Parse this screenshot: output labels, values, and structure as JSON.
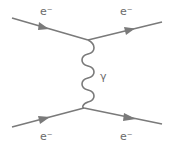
{
  "diagram": {
    "type": "feynman",
    "line_color": "#7a7a7a",
    "particles": {
      "incoming_top": {
        "label": "e⁻"
      },
      "outgoing_top": {
        "label": "e⁻"
      },
      "incoming_bottom": {
        "label": "e⁻"
      },
      "outgoing_bottom": {
        "label": "e⁻"
      },
      "propagator": {
        "label": "γ"
      }
    }
  }
}
